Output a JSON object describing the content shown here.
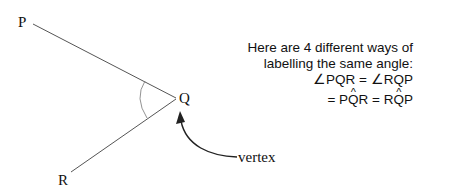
{
  "diagram": {
    "points": {
      "P": {
        "label": "P",
        "x": 33,
        "y": 24
      },
      "Q": {
        "label": "Q",
        "x": 177,
        "y": 98
      },
      "R": {
        "label": "R",
        "x": 70,
        "y": 172
      }
    },
    "vertex_label": "vertex",
    "line_color": "#555555",
    "arrow_color": "#222222"
  },
  "note": {
    "line1": "Here are 4 different ways of",
    "line2": "labelling the same angle:",
    "line3": "∠PQR = ∠RQP",
    "line4_prefix": "= P",
    "line4_hat1": "Q",
    "line4_mid": "R = R",
    "line4_hat2": "Q",
    "line4_suffix": "P"
  }
}
